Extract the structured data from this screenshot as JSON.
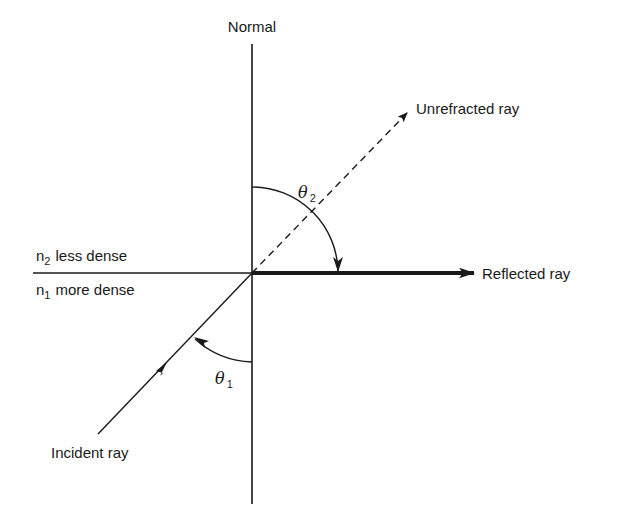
{
  "labels": {
    "normal": "Normal",
    "unrefracted_ray": "Unrefracted ray",
    "reflected_ray": "Reflected ray",
    "incident_ray": "Incident ray",
    "medium_top": {
      "symbol": "n",
      "subscript": "2",
      "text": "less dense"
    },
    "medium_bottom": {
      "symbol": "n",
      "subscript": "1",
      "text": "more dense"
    },
    "angle_incident": {
      "symbol": "θ",
      "subscript": "1"
    },
    "angle_refracted": {
      "symbol": "θ",
      "subscript": "2"
    }
  },
  "colors": {
    "ink": "#1a1a1a",
    "background": "#ffffff"
  }
}
